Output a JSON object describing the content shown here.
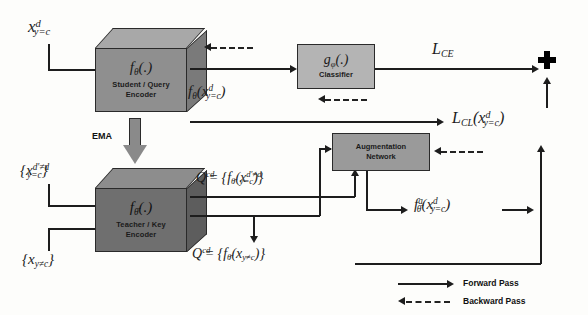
{
  "figure": {
    "type": "architecture-diagram"
  },
  "inputs": {
    "student_input": "x",
    "student_input_sup": "d",
    "student_input_sub": "y=c",
    "teacher_input_pos": "{x",
    "teacher_input_pos_sup": "d′≠d",
    "teacher_input_pos_sub": "y=c",
    "teacher_input_pos_close": "}",
    "teacher_input_neg": "{x",
    "teacher_input_neg_sub": "y≠c",
    "teacher_input_neg_close": "}"
  },
  "blocks": {
    "student": {
      "fn": "f",
      "fn_sub": "θ",
      "fn_args": "(.)",
      "caption_line1": "Student / Query",
      "caption_line2": "Encoder",
      "fill": "#8f8f8f",
      "top_fill": "#a8a8a8",
      "side_fill": "#7a7a7a"
    },
    "teacher": {
      "fn": "f",
      "fn_sub": "θ̄",
      "fn_args": "(.)",
      "caption_line1": "Teacher / Key",
      "caption_line2": "Encoder",
      "fill": "#6f6f6f",
      "top_fill": "#8d8d8d",
      "side_fill": "#5d5d5d"
    },
    "classifier": {
      "fn": "g",
      "fn_sub": "φ",
      "fn_args": "(.)",
      "caption": "Classifier",
      "fill": "#b4b4b4"
    },
    "augmentation": {
      "caption_line1": "Augmentation",
      "caption_line2": "Network",
      "fill": "#9a9a9a"
    }
  },
  "labels": {
    "ema": "EMA",
    "student_output": "f",
    "student_output_sub": "θ",
    "student_output_arg": "(x",
    "student_output_arg_sup": "d",
    "student_output_arg_sub": "y=c",
    "student_output_close": ")",
    "loss_ce": "L",
    "loss_ce_sub": "CE",
    "loss_cl": "L",
    "loss_cl_sub": "CL",
    "loss_cl_arg": "(x",
    "loss_cl_arg_sup": "d",
    "loss_cl_arg_sub": "y=c",
    "loss_cl_close": ")",
    "queue_pos": "Q",
    "queue_pos_sup": "cd",
    "queue_pos_sub": "+",
    "queue_pos_eq": " = {f",
    "queue_pos_fn_sub": "θ̄",
    "queue_pos_arg": "(x",
    "queue_pos_arg_sup": "d′≠d",
    "queue_pos_arg_sub": "y=c",
    "queue_pos_close": ")}",
    "queue_neg": "Q",
    "queue_neg_sup": "cd",
    "queue_neg_sub": "−",
    "queue_neg_eq": " = {f",
    "queue_neg_fn_sub": "θ̄",
    "queue_neg_arg": "(x",
    "queue_neg_arg_sub": "y≠c",
    "queue_neg_close": ")}",
    "aug_output": "f",
    "aug_output_sup": "a",
    "aug_output_sub": "θ̄",
    "aug_output_arg": "(x",
    "aug_output_arg_sup": "d",
    "aug_output_arg_sub": "y=c",
    "aug_output_close": ")",
    "plus_symbol": "+"
  },
  "legend": {
    "forward": "Forward Pass",
    "backward": "Backward Pass"
  },
  "colors": {
    "line": "#1d1d1d",
    "background": "#fdfdfb",
    "text": "#1a1a1a"
  }
}
